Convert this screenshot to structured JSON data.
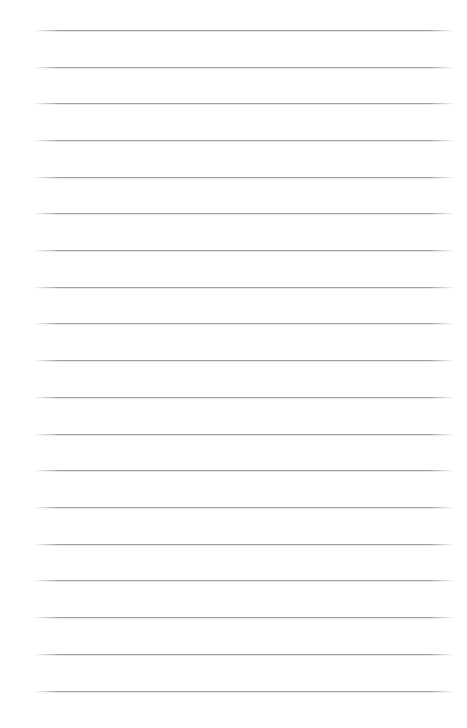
{
  "document": {
    "kind": "lined-paper-sheet",
    "title": "",
    "page_width": 467,
    "page_height": 728,
    "background_color": "#ffffff",
    "orientation": "portrait",
    "is_blank": true,
    "header_text": "",
    "footer_text": "",
    "page_number": "",
    "margin_note": ""
  },
  "ruling": {
    "line_color": "#9a9a9a",
    "line_thickness_px": 1,
    "line_spacing_px": 36.7,
    "line_start_x": 33,
    "line_end_x": 455,
    "first_line_y": 30,
    "last_line_y": 691,
    "line_count": 19,
    "has_vertical_margin_rule": false,
    "line_y_positions": [
      30,
      67,
      103,
      140,
      177,
      213,
      250,
      287,
      323,
      360,
      397,
      434,
      470,
      507,
      544,
      580,
      617,
      654,
      691
    ]
  },
  "content": {
    "lines": [
      "",
      "",
      "",
      "",
      "",
      "",
      "",
      "",
      "",
      "",
      "",
      "",
      "",
      "",
      "",
      "",
      "",
      "",
      ""
    ]
  }
}
